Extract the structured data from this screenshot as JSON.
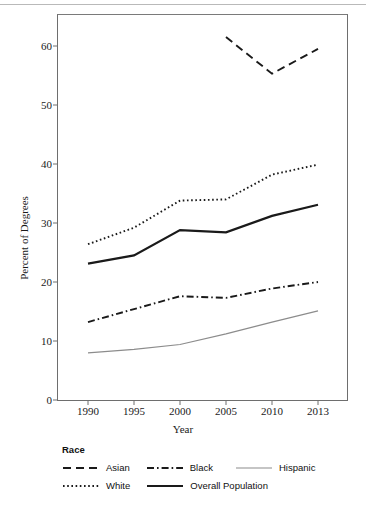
{
  "figure": {
    "y_axis_title": "Percent of Degrees",
    "x_axis_title": "Year"
  },
  "legend": {
    "title": "Race",
    "entries": [
      {
        "label": "Asian",
        "style": "dashed",
        "color": "#1a1a1a"
      },
      {
        "label": "Black",
        "style": "dash-dot",
        "color": "#1a1a1a"
      },
      {
        "label": "Hispanic",
        "style": "solid-thin",
        "color": "#8c8c8c"
      },
      {
        "label": "White",
        "style": "dotted",
        "color": "#1a1a1a"
      },
      {
        "label": "Overall Population",
        "style": "solid-thick",
        "color": "#1a1a1a"
      }
    ]
  },
  "axes": {
    "y_ticks": [
      "60",
      "50",
      "40",
      "30",
      "20",
      "10",
      "0"
    ],
    "x_ticks": [
      "1990",
      "1995",
      "2000",
      "2005",
      "2010",
      "2013"
    ]
  },
  "chart_data": {
    "type": "line",
    "title": "",
    "xlabel": "Year",
    "ylabel": "Percent of Degrees",
    "categories": [
      "1990",
      "1995",
      "2000",
      "2005",
      "2010",
      "2013"
    ],
    "ylim": [
      0,
      65
    ],
    "yticks": [
      0,
      10,
      20,
      30,
      40,
      50,
      60
    ],
    "grid": false,
    "legend_position": "below-axes",
    "legend_title": "Race",
    "series": [
      {
        "name": "Asian",
        "style": "dashed",
        "color": "#1a1a1a",
        "values": [
          null,
          null,
          null,
          61.5,
          55.3,
          59.5
        ]
      },
      {
        "name": "Black",
        "style": "dash-dot",
        "color": "#1a1a1a",
        "values": [
          13.2,
          15.4,
          17.6,
          17.3,
          18.9,
          20.0
        ]
      },
      {
        "name": "Hispanic",
        "style": "solid-thin",
        "color": "#8c8c8c",
        "values": [
          8.0,
          8.6,
          9.4,
          11.2,
          13.2,
          15.1
        ]
      },
      {
        "name": "White",
        "style": "dotted",
        "color": "#1a1a1a",
        "values": [
          26.4,
          29.2,
          33.8,
          34.0,
          38.2,
          39.9
        ]
      },
      {
        "name": "Overall Population",
        "style": "solid-thick",
        "color": "#1a1a1a",
        "values": [
          23.1,
          24.5,
          28.8,
          28.4,
          31.2,
          33.1
        ]
      }
    ]
  }
}
